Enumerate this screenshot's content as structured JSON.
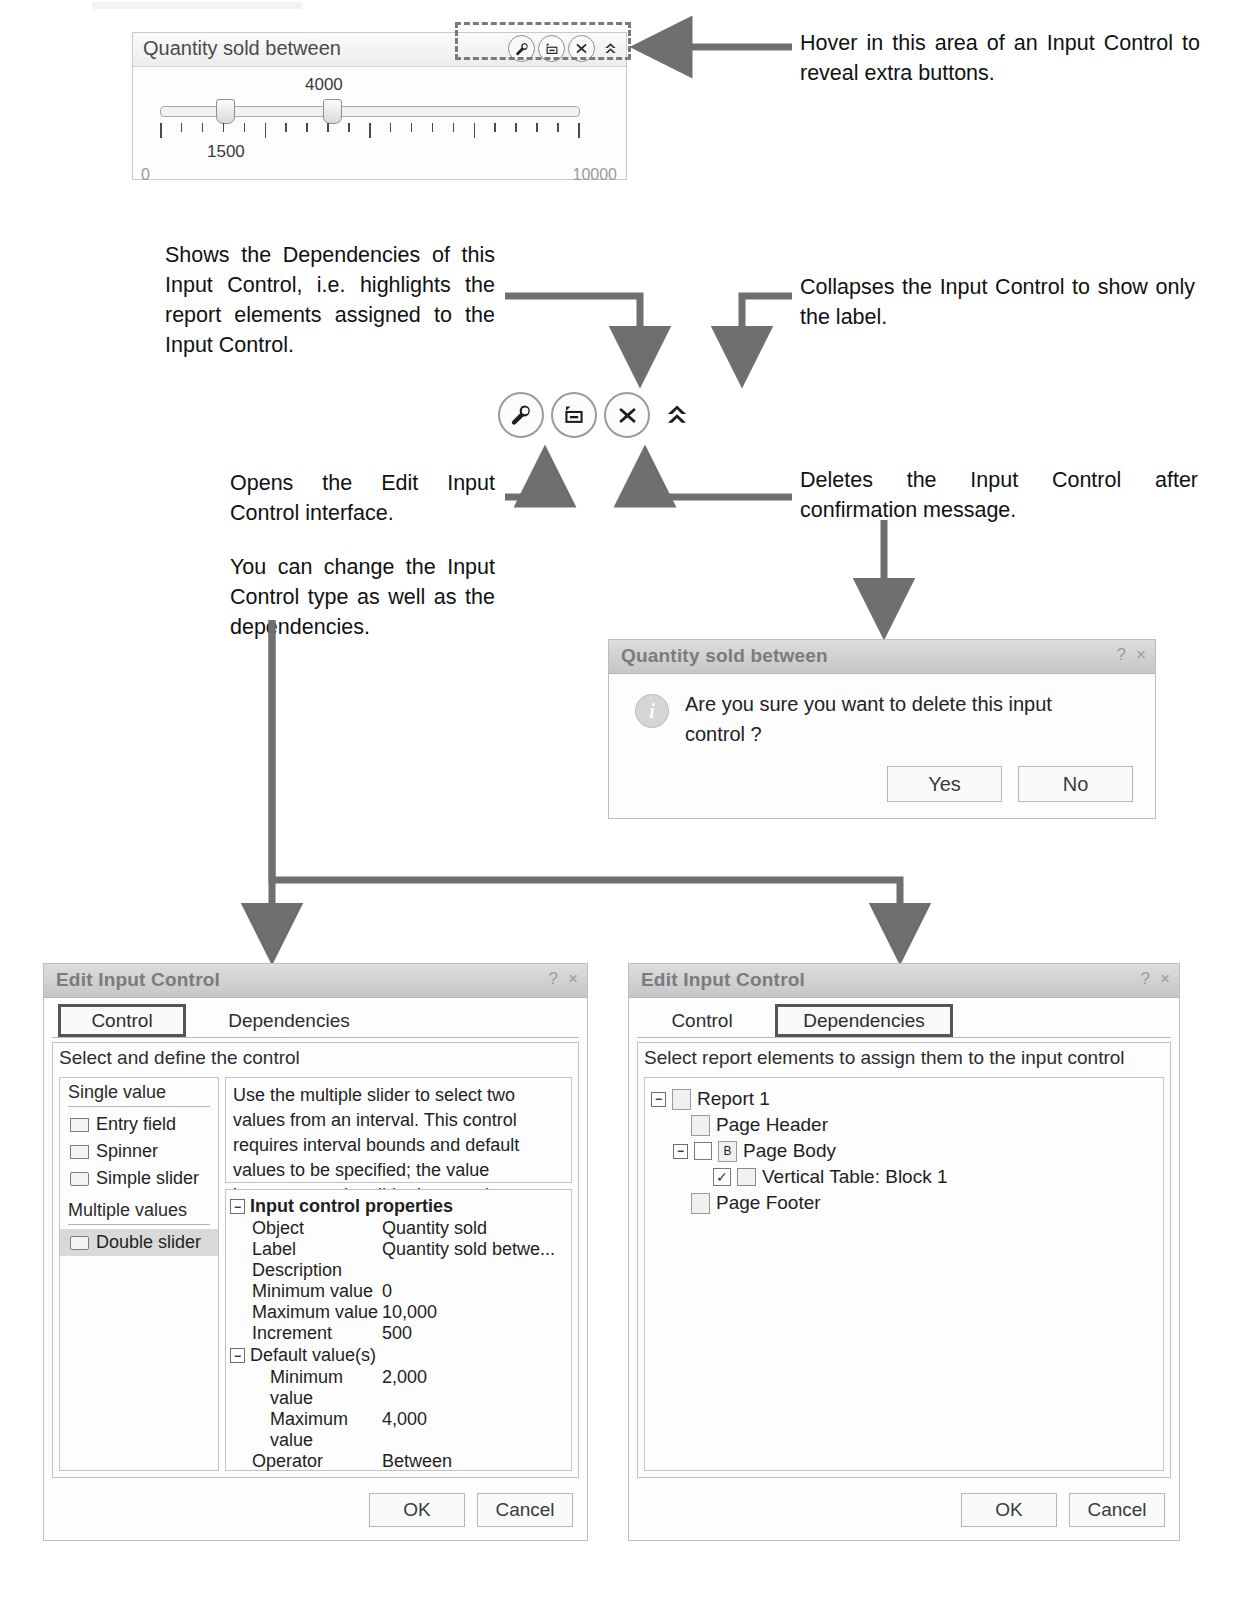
{
  "input_control": {
    "title": "Quantity sold between",
    "buttons": [
      {
        "name": "edit",
        "icon": "wrench-icon"
      },
      {
        "name": "dependencies",
        "icon": "dependencies-icon"
      },
      {
        "name": "delete",
        "icon": "close-x-icon"
      },
      {
        "name": "collapse",
        "icon": "double-chevron-up-icon"
      }
    ],
    "slider": {
      "value_high": "4000",
      "value_low": "1500",
      "min": "0",
      "max": "10000"
    }
  },
  "annotations": {
    "hover": "Hover in this area of an Input Control to reveal extra buttons.",
    "dependencies": "Shows the Dependencies of this Input Control, i.e. highlights the report elements assigned to the Input Control.",
    "collapse": "Collapses the Input Control to show only the label.",
    "edit": "Opens the Edit Input Control interface.",
    "edit_more": "You can change the Input Control type as well as the dependencies.",
    "delete": "Deletes the Input Control after confirmation message."
  },
  "confirm_dialog": {
    "title": "Quantity sold between",
    "help_label": "?",
    "close_label": "×",
    "icon": "info-icon",
    "message": "Are you sure you want to delete this input control ?",
    "yes_label": "Yes",
    "no_label": "No"
  },
  "edit_dialog_control": {
    "title": "Edit Input Control",
    "help_label": "?",
    "close_label": "×",
    "tabs": [
      {
        "label": "Control",
        "selected": true
      },
      {
        "label": "Dependencies",
        "selected": false
      }
    ],
    "panel_heading": "Select and define the control",
    "groups": [
      {
        "heading": "Single value",
        "items": [
          "Entry field",
          "Spinner",
          "Simple slider"
        ]
      },
      {
        "heading": "Multiple values",
        "items": [
          "Double slider"
        ]
      }
    ],
    "selected_type": "Double slider",
    "description": "Use the multiple slider to select two values from an interval. This control requires interval bounds and default values to be specified; the value increases as the slider is moved.",
    "properties_group_label": "Input control properties",
    "properties": [
      {
        "key": "Object",
        "value": "Quantity sold"
      },
      {
        "key": "Label",
        "value": "Quantity sold betwe..."
      },
      {
        "key": "Description",
        "value": ""
      },
      {
        "key": "Minimum value",
        "value": "0"
      },
      {
        "key": "Maximum value",
        "value": "10,000"
      },
      {
        "key": "Increment",
        "value": "500"
      }
    ],
    "default_group_label": "Default value(s)",
    "default_properties": [
      {
        "key": "Minimum value",
        "value": "2,000"
      },
      {
        "key": "Maximum value",
        "value": "4,000"
      }
    ],
    "operator": {
      "key": "Operator",
      "value": "Between"
    },
    "ok_label": "OK",
    "cancel_label": "Cancel"
  },
  "edit_dialog_dependencies": {
    "title": "Edit Input Control",
    "help_label": "?",
    "close_label": "×",
    "tabs": [
      {
        "label": "Control",
        "selected": false
      },
      {
        "label": "Dependencies",
        "selected": true
      }
    ],
    "panel_heading": "Select report elements to assign them to the input control",
    "tree": [
      {
        "label": "Report 1",
        "level": 0,
        "expander": "−",
        "icon": "report-icon",
        "checked": false
      },
      {
        "label": "Page Header",
        "level": 1,
        "expander": "",
        "icon": "page-icon",
        "checked": false
      },
      {
        "label": "Page Body",
        "level": 1,
        "expander": "−",
        "icon": "body-icon",
        "checked": false
      },
      {
        "label": "Vertical Table: Block 1",
        "level": 2,
        "expander": "",
        "icon": "table-icon",
        "checked": true
      },
      {
        "label": "Page Footer",
        "level": 1,
        "expander": "",
        "icon": "page-icon",
        "checked": false
      }
    ],
    "ok_label": "OK",
    "cancel_label": "Cancel"
  },
  "colors": {
    "arrow": "#6f6f6f",
    "dialog_title_bg": "#cfcfcf",
    "selection": "#d9d9d9"
  }
}
